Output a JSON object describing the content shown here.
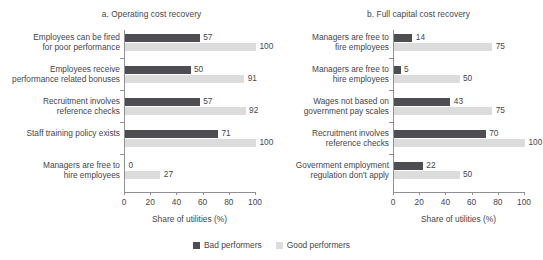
{
  "top_caption_fragment": "",
  "legend": {
    "items": [
      {
        "label": "Bad performers",
        "color": "#4d4d52"
      },
      {
        "label": "Good performers",
        "color": "#dcdcdc"
      }
    ]
  },
  "chart_data": [
    {
      "type": "bar",
      "orientation": "horizontal",
      "panel": "a",
      "title": "a. Operating cost recovery",
      "xlabel": "Share of utilities (%)",
      "ylabel": "",
      "xlim": [
        0,
        100
      ],
      "xticks": [
        0,
        20,
        40,
        60,
        80,
        100
      ],
      "grid": false,
      "legend_position": "bottom-center-shared",
      "categories": [
        "Employees can be fired for poor performance",
        "Employees receive performance related bonuses",
        "Recruitment involves reference checks",
        "Staff training policy exists",
        "Managers are free to hire employees"
      ],
      "category_lines": [
        [
          "Employees can be fired",
          "for poor performance"
        ],
        [
          "Employees receive",
          "performance related bonuses"
        ],
        [
          "Recruitment involves",
          "reference checks"
        ],
        [
          "Staff training policy exists",
          ""
        ],
        [
          "Managers are free to",
          "hire employees"
        ]
      ],
      "series": [
        {
          "name": "Bad performers",
          "color": "#4d4d52",
          "values": [
            57,
            50,
            57,
            71,
            0
          ]
        },
        {
          "name": "Good performers",
          "color": "#dcdcdc",
          "values": [
            100,
            91,
            92,
            100,
            27
          ]
        }
      ]
    },
    {
      "type": "bar",
      "orientation": "horizontal",
      "panel": "b",
      "title": "b. Full capital cost recovery",
      "xlabel": "Share of utilities (%)",
      "ylabel": "",
      "xlim": [
        0,
        100
      ],
      "xticks": [
        0,
        20,
        40,
        60,
        80,
        100
      ],
      "grid": false,
      "legend_position": "bottom-center-shared",
      "categories": [
        "Managers are free to fire employees",
        "Managers are free to hire employees",
        "Wages not based on government pay scales",
        "Recruitment involves reference checks",
        "Government employment regulation don't apply"
      ],
      "category_lines": [
        [
          "Managers are free to",
          "fire employees"
        ],
        [
          "Managers are free to",
          "hire employees"
        ],
        [
          "Wages not based on",
          "government pay scales"
        ],
        [
          "Recruitment involves",
          "reference checks"
        ],
        [
          "Government employment",
          "regulation don't apply"
        ]
      ],
      "series": [
        {
          "name": "Bad performers",
          "color": "#4d4d52",
          "values": [
            14,
            5,
            43,
            70,
            22
          ]
        },
        {
          "name": "Good performers",
          "color": "#dcdcdc",
          "values": [
            75,
            50,
            75,
            100,
            50
          ]
        }
      ]
    }
  ]
}
